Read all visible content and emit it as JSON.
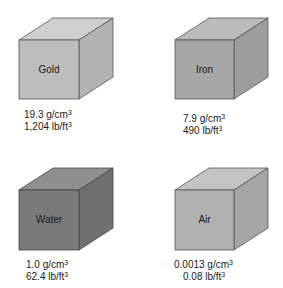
{
  "cubes": [
    {
      "name": "Gold",
      "density_metric": "19.3 g/cm",
      "density_imperial": "1,204 lb/ft",
      "exponent": "3",
      "colors": {
        "front": "#bdbdbd",
        "top": "#cfcfcf",
        "side": "#b3b3b3"
      }
    },
    {
      "name": "Iron",
      "density_metric": "7.9 g/cm",
      "density_imperial": "490 lb/ft",
      "exponent": "3",
      "colors": {
        "front": "#a7a7a7",
        "top": "#bbbbbb",
        "side": "#9d9d9d"
      }
    },
    {
      "name": "Water",
      "density_metric": "1.0 g/cm",
      "density_imperial": "62.4 lb/ft",
      "exponent": "3",
      "colors": {
        "front": "#7a7a7a",
        "top": "#8f8f8f",
        "side": "#707070"
      }
    },
    {
      "name": "Air",
      "density_metric": "0.0013 g/cm",
      "density_imperial": "0.08 lb/ft",
      "exponent": "3",
      "colors": {
        "front": "#b0b0b0",
        "top": "#c4c4c4",
        "side": "#a6a6a6"
      }
    }
  ]
}
